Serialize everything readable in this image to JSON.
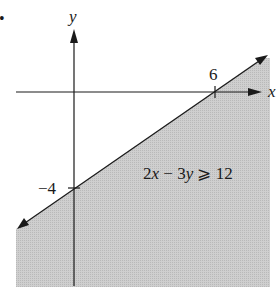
{
  "figure": {
    "bullet": "•",
    "axes": {
      "x_label": "x",
      "y_label": "y",
      "x_tick_label": "6",
      "y_tick_label": "−4"
    },
    "inequality": {
      "lhs_coef_x": "2",
      "var_x": "x",
      "minus": " − ",
      "lhs_coef_y": "3",
      "var_y": "y",
      "relation": " ⩾ ",
      "rhs": "12"
    },
    "colors": {
      "shade": "#c8c8c8",
      "line": "#1a1a1a",
      "background": "#ffffff"
    }
  }
}
